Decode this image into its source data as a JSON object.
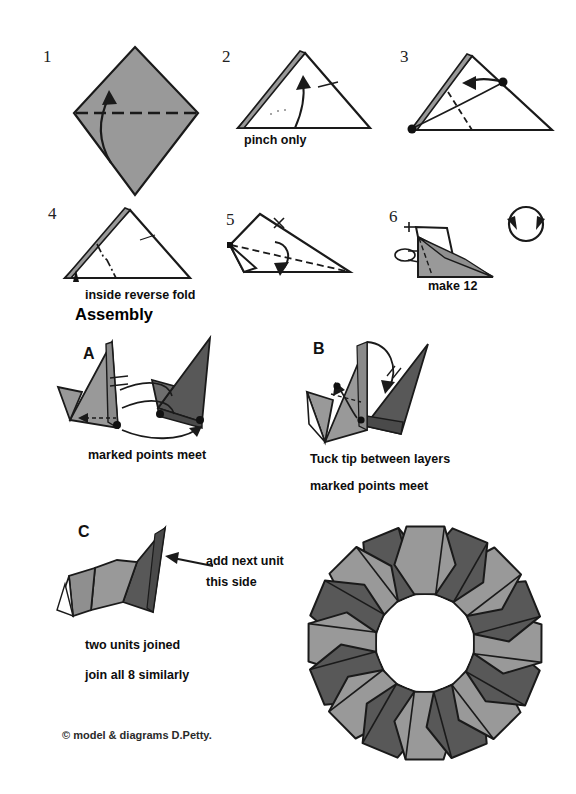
{
  "document": {
    "title": "Modular Origami Ring Diagram",
    "heading_assembly": "Assembly",
    "copyright": "©  model & diagrams D.Petty."
  },
  "colors": {
    "paper_light": "#999999",
    "paper_dark": "#585858",
    "paper_white": "#ffffff",
    "line": "#1a1a1a",
    "background": "#ffffff"
  },
  "steps": [
    {
      "id": "step-1",
      "number": "1",
      "caption": "",
      "description": "gray square rotated 45 degrees with horizontal valley fold line and upward curved arrow"
    },
    {
      "id": "step-2",
      "number": "2",
      "caption": "pinch only",
      "description": "white triangle with gray sliver on upper left edge, curved arrow upward"
    },
    {
      "id": "step-3",
      "number": "3",
      "caption": "",
      "description": "triangle with two marked black points, dashed fold line, curved arrow to the left"
    },
    {
      "id": "step-4",
      "number": "4",
      "caption": "inside reverse fold",
      "description": "triangle with dash-dot fold line and small solid arrowhead below"
    },
    {
      "id": "step-5",
      "number": "5",
      "caption": "",
      "description": "angled shape with dashed fold line and downward curved arrow"
    },
    {
      "id": "step-6",
      "number": "6",
      "caption": "make 12",
      "description": "finished gray unit with rotate/turn-over symbol at right"
    }
  ],
  "assembly": [
    {
      "id": "step-a",
      "number": "A",
      "captions": [
        "marked points meet"
      ],
      "description": "light gray unit at left and dark gray unit at right with marked points and arrows"
    },
    {
      "id": "step-b",
      "number": "B",
      "captions": [
        "Tuck tip between layers",
        "marked points meet"
      ],
      "description": "two units being joined, tip tucked between layers"
    },
    {
      "id": "step-c",
      "number": "C",
      "captions": [
        "two units joined",
        "join all 8 similarly"
      ],
      "annotation": [
        "add next unit",
        "this side"
      ],
      "description": "two joined units with arrow pointing to join side"
    }
  ],
  "final_model": {
    "id": "final-ring",
    "unit_count": 16,
    "description": "completed modular ring of alternating light and dark gray units around white center"
  },
  "symbols": {
    "turn_over": "rotate-symbol",
    "arrow_left": "←"
  }
}
